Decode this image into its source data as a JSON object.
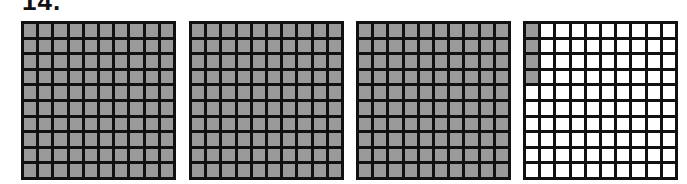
{
  "problem": {
    "label": "14."
  },
  "colors": {
    "shaded": "#9a9a9a",
    "unshaded": "#ffffff",
    "line": "#111111"
  },
  "grids": [
    {
      "rows": 10,
      "cols": 10,
      "shaded_cells": 100,
      "left": 21
    },
    {
      "rows": 10,
      "cols": 10,
      "shaded_cells": 100,
      "left": 189
    },
    {
      "rows": 10,
      "cols": 10,
      "shaded_cells": 100,
      "left": 356
    },
    {
      "rows": 10,
      "cols": 10,
      "shaded_cells": 4,
      "shaded_pattern": "first column, rows 1-4",
      "left": 523
    }
  ],
  "represents": "3.04"
}
